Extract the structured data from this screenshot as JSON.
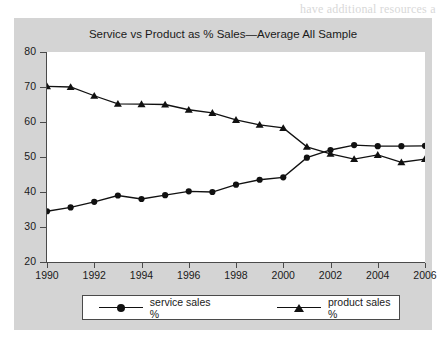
{
  "page": {
    "background_color": "#ffffff",
    "bleed_lines": [
      {
        "text": "have additional resources a",
        "x": 300,
        "y": 2
      },
      {
        "text": "tion to give",
        "x": 300,
        "y": 16
      },
      {
        "text": "resource",
        "x": 300,
        "y": 30
      },
      {
        "text": "API and an web services",
        "x": 300,
        "y": 44
      },
      {
        "text": "ner, functions a serv",
        "x": 300,
        "y": 58
      },
      {
        "text": "opportunity and a con",
        "x": 300,
        "y": 72
      },
      {
        "text": "We can also offer a f",
        "x": 300,
        "y": 86
      },
      {
        "text": "market pull and",
        "x": 300,
        "y": 100
      },
      {
        "text": "an end user selection",
        "x": 300,
        "y": 114
      },
      {
        "text": "mode of delivery our",
        "x": 300,
        "y": 128
      },
      {
        "text": "field, profits, and",
        "x": 300,
        "y": 142
      },
      {
        "text": "accompanying resources",
        "x": 300,
        "y": 156
      },
      {
        "text": "to Microsoft and",
        "x": 300,
        "y": 170
      },
      {
        "text": "rendering sales unit",
        "x": 300,
        "y": 184
      },
      {
        "text": "sales, and sale",
        "x": 300,
        "y": 198
      },
      {
        "text": "unit of comput",
        "x": 300,
        "y": 212
      },
      {
        "text": "time, seen a",
        "x": 300,
        "y": 226
      },
      {
        "text": "born while during",
        "x": 300,
        "y": 240
      },
      {
        "text": "some other assessm",
        "x": 300,
        "y": 254
      },
      {
        "text": "to 1997",
        "x": 300,
        "y": 268
      },
      {
        "text": "table",
        "x": 300,
        "y": 282
      }
    ]
  },
  "figure": {
    "panel_color": "#d4d4d4",
    "plot_background": "#ffffff",
    "axis_color": "#4a4a4a",
    "series_color": "#111111"
  },
  "legend": {
    "position": "below-plot",
    "items": [
      {
        "label": "service sales %",
        "marker": "circle",
        "color": "#111111"
      },
      {
        "label": "product sales %",
        "marker": "triangle",
        "color": "#111111"
      }
    ]
  },
  "chart_data": {
    "type": "line",
    "title": "Service vs Product as % Sales—Average All Sample",
    "xlabel": "",
    "ylabel": "",
    "xlim": [
      1990,
      2006
    ],
    "ylim": [
      20,
      80
    ],
    "grid": false,
    "legend_position": "bottom",
    "x": [
      1990,
      1991,
      1992,
      1993,
      1994,
      1995,
      1996,
      1997,
      1998,
      1999,
      2000,
      2001,
      2002,
      2003,
      2004,
      2005,
      2006
    ],
    "xticks": [
      1990,
      1992,
      1994,
      1996,
      1998,
      2000,
      2002,
      2004,
      2006
    ],
    "xtick_labels": [
      "1990",
      "1992",
      "1994",
      "1996",
      "1998",
      "2000",
      "2002",
      "2004",
      "2006"
    ],
    "yticks": [
      20,
      30,
      40,
      50,
      60,
      70,
      80
    ],
    "ytick_labels": [
      "20",
      "30",
      "40",
      "50",
      "60",
      "70",
      "80"
    ],
    "series": [
      {
        "name": "service sales %",
        "marker": "circle",
        "color": "#111111",
        "values": [
          34.5,
          35.6,
          37.2,
          39.0,
          38.0,
          39.1,
          40.2,
          40.0,
          42.1,
          43.5,
          44.2,
          49.8,
          52.0,
          53.4,
          53.1,
          53.1,
          53.2
        ]
      },
      {
        "name": "product sales %",
        "marker": "triangle",
        "color": "#111111",
        "values": [
          70.2,
          70.0,
          67.5,
          65.2,
          65.1,
          65.0,
          63.5,
          62.6,
          60.6,
          59.2,
          58.3,
          52.9,
          50.9,
          49.4,
          50.6,
          48.5,
          49.4
        ]
      }
    ]
  }
}
